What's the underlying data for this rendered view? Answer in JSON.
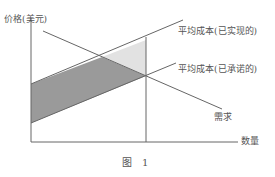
{
  "diagram": {
    "y_axis_label": "价格(美元)",
    "x_axis_label": "数量",
    "curves": {
      "avg_cost_realized": "平均成本(已实现的)",
      "avg_cost_committed": "平均成本(已承诺的)",
      "demand": "需求"
    },
    "caption": "图　1",
    "colors": {
      "line": "#666666",
      "dark_region": "#9a9a9a",
      "light_region": "#e2e2e2"
    }
  }
}
